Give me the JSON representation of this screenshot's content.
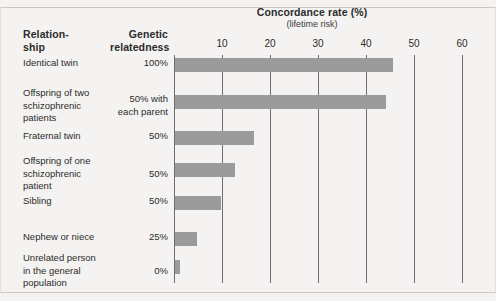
{
  "figure": {
    "background": "#f4f3f1",
    "bar_color": "#9b9b9b",
    "grid_color": "#6e6e6e",
    "text_color": "#2b2b2b"
  },
  "headers": {
    "relationship": "Relation-\nship",
    "relationship_line1": "Relation-",
    "relationship_line2": "ship",
    "genetic": "Genetic\nrelatedness",
    "genetic_line1": "Genetic",
    "genetic_line2": "relatedness"
  },
  "chart_data": {
    "type": "bar",
    "orientation": "horizontal",
    "title": "Concordance rate (%)",
    "subtitle": "(lifetime risk)",
    "xlabel": "",
    "ylabel": "",
    "xlim": [
      0,
      65
    ],
    "ticks": [
      10,
      20,
      30,
      40,
      50,
      60
    ],
    "tick_labels": [
      "10",
      "20",
      "30",
      "40",
      "50",
      "60"
    ],
    "grid": true,
    "legend": "none",
    "categories": [
      "Identical twin",
      "Offspring of two schizophrenic patients",
      "Fraternal twin",
      "Offspring of one schizophrenic patient",
      "Sibling",
      "Nephew or niece",
      "Unrelated person in the general population"
    ],
    "values": [
      45.5,
      44,
      16.5,
      12.5,
      9.5,
      4.5,
      1
    ],
    "genetic_relatedness": [
      "100%",
      "50% with each parent",
      "50%",
      "50%",
      "50%",
      "25%",
      "0%"
    ]
  },
  "rows": [
    {
      "label_lines": [
        "Identical twin"
      ],
      "value_lines": [
        "100%"
      ],
      "value": 45.5,
      "top": 57,
      "bar_top": 58
    },
    {
      "label_lines": [
        "Offspring of two",
        "schizophrenic",
        "patients"
      ],
      "value_lines": [
        "50% with",
        "each parent"
      ],
      "value": 44,
      "top": 87,
      "bar_top": 95
    },
    {
      "label_lines": [
        "Fraternal twin"
      ],
      "value_lines": [
        "50%"
      ],
      "value": 16.5,
      "top": 130,
      "bar_top": 131
    },
    {
      "label_lines": [
        "Offspring of one",
        "schizophrenic",
        "patient"
      ],
      "value_lines": [
        "50%"
      ],
      "value": 12.5,
      "top": 155,
      "bar_top": 163
    },
    {
      "label_lines": [
        "Sibling"
      ],
      "value_lines": [
        "50%"
      ],
      "value": 9.5,
      "top": 195,
      "bar_top": 196
    },
    {
      "label_lines": [
        "Nephew or niece"
      ],
      "value_lines": [
        "25%"
      ],
      "value": 4.5,
      "top": 231,
      "bar_top": 232
    },
    {
      "label_lines": [
        "Unrelated person",
        "in the general",
        "population"
      ],
      "value_lines": [
        "0%"
      ],
      "value": 1,
      "top": 252,
      "bar_top": 260
    }
  ]
}
